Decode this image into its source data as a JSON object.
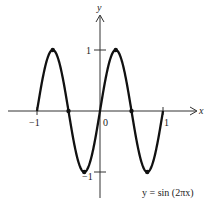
{
  "chart_data": {
    "type": "line",
    "title": "",
    "xlabel": "x",
    "ylabel": "y",
    "annotation": "y = sin (2πx)",
    "function": "sin(2*pi*x)",
    "xlim": [
      -1,
      1
    ],
    "ylim": [
      -1,
      1
    ],
    "grid": false,
    "x_ticks": [
      {
        "value": -1,
        "label": "−1"
      },
      {
        "value": 0,
        "label": "0"
      },
      {
        "value": 1,
        "label": "1"
      }
    ],
    "y_ticks": [
      {
        "value": 1,
        "label": "1"
      },
      {
        "value": -1,
        "label": "−1"
      }
    ],
    "marked_points": [
      {
        "x": -0.75,
        "y": 1
      },
      {
        "x": -0.5,
        "y": 0
      },
      {
        "x": -0.25,
        "y": -1
      },
      {
        "x": 0.25,
        "y": 1
      },
      {
        "x": 0.5,
        "y": 0
      },
      {
        "x": 0.75,
        "y": -1
      }
    ],
    "series": [
      {
        "name": "y = sin (2πx)",
        "x_range": [
          -1,
          1
        ],
        "samples": 400,
        "color": "#111111"
      }
    ]
  },
  "labels": {
    "x_axis": "x",
    "y_axis": "y",
    "tick_x_neg1": "−1",
    "tick_x_0": "0",
    "tick_x_1": "1",
    "tick_y_1": "1",
    "tick_y_neg1": "−1",
    "annotation": "y = sin (2πx)"
  }
}
